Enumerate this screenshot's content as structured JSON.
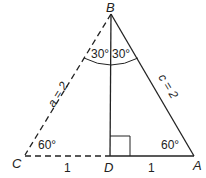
{
  "diagram": {
    "vertices": {
      "B": {
        "label": "B",
        "x": 111,
        "y": 14
      },
      "C": {
        "label": "C",
        "x": 25,
        "y": 155
      },
      "D": {
        "label": "D",
        "x": 110,
        "y": 156
      },
      "A": {
        "label": "A",
        "x": 194,
        "y": 156
      }
    },
    "sides": {
      "a": {
        "label": "a = 2",
        "style": "dashed",
        "from": "B",
        "to": "C"
      },
      "c": {
        "label": "c = 2",
        "style": "solid",
        "from": "B",
        "to": "A"
      },
      "CD": {
        "label": "1",
        "style": "dashed"
      },
      "DA": {
        "label": "1",
        "style": "solid"
      },
      "BD": {
        "label": "",
        "style": "solid"
      }
    },
    "angles": {
      "B_left": "30°",
      "B_right": "30°",
      "C": "60°",
      "A": "60°"
    },
    "right_angle_at": "D",
    "colors": {
      "stroke": "#222222",
      "background": "#ffffff"
    }
  }
}
